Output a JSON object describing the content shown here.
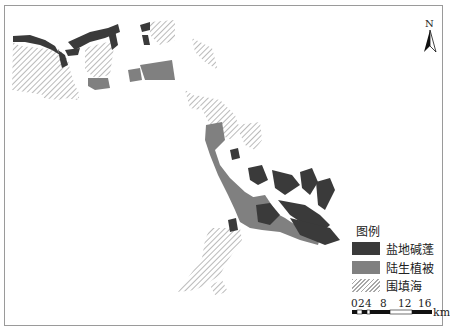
{
  "map": {
    "north_arrow_label": "N",
    "legend": {
      "title": "图例",
      "items": [
        {
          "label": "盐地碱蓬",
          "color": "#3a3a3a",
          "pattern": "solid",
          "icon": "dark-fill-swatch"
        },
        {
          "label": "陆生植被",
          "color": "#808080",
          "pattern": "solid",
          "icon": "gray-fill-swatch"
        },
        {
          "label": "围填海",
          "color": "#a8a8a8",
          "pattern": "hatch",
          "icon": "hatched-swatch"
        }
      ]
    },
    "scale_bar": {
      "ticks": [
        "0",
        "2",
        "4",
        "8",
        "12",
        "16"
      ],
      "unit": "km"
    },
    "colors": {
      "suaeda": "#3a3a3a",
      "vegetation": "#808080",
      "reclamation_hatch": "#a8a8a8",
      "frame": "#9a9a9a"
    }
  }
}
